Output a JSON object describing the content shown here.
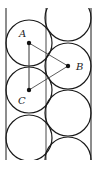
{
  "figure": {
    "labels": {
      "a": "A",
      "b": "B",
      "c": "C"
    },
    "stroke_color": "#1a1a1a",
    "walls": {
      "left_x": 6,
      "right_x": 91,
      "top_y": 8,
      "bottom_y": 160
    },
    "circle_radius": 23,
    "left_column": [
      {
        "cx": 29,
        "cy": 43,
        "name": "A"
      },
      {
        "cx": 29,
        "cy": 90,
        "name": "C"
      },
      {
        "cx": 29,
        "cy": 138
      }
    ],
    "right_column": [
      {
        "cx": 68,
        "cy": 18
      },
      {
        "cx": 68,
        "cy": 66,
        "name": "B"
      },
      {
        "cx": 68,
        "cy": 113
      },
      {
        "cx": 68,
        "cy": 160
      }
    ]
  }
}
